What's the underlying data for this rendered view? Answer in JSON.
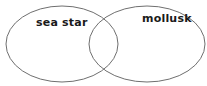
{
  "diagram": {
    "type": "venn",
    "background_color": "#ffffff",
    "stroke_color": "#6f6f6f",
    "text_color": "#1a1a1a",
    "sets": [
      {
        "id": "left",
        "label": "sea star",
        "cx": 62,
        "cy": 44,
        "rx": 56,
        "ry": 38
      },
      {
        "id": "right",
        "label": "mollusk",
        "cx": 147,
        "cy": 44,
        "rx": 58,
        "ry": 38
      }
    ]
  }
}
